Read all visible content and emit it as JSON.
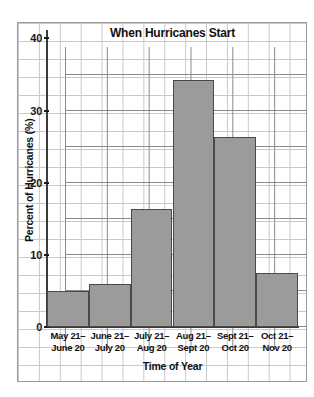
{
  "chart_data": {
    "type": "bar",
    "title": "When Hurricanes Start",
    "xlabel": "Time of Year",
    "ylabel": "Percent of Hurricanes (%)",
    "categories": [
      "May 21– June 20",
      "June 21– July 20",
      "July 21– Aug 20",
      "Aug 21– Sept 20",
      "Sept 21– Oct 20",
      "Oct 21– Nov 20"
    ],
    "category_lines": [
      [
        "May 21–",
        "June 20"
      ],
      [
        "June 21–",
        "July 20"
      ],
      [
        "July 21–",
        "Aug 20"
      ],
      [
        "Aug 21–",
        "Sept 20"
      ],
      [
        "Sept 21–",
        "Oct 20"
      ],
      [
        "Oct 21–",
        "Nov 20"
      ]
    ],
    "values": [
      5,
      6,
      16.3,
      34.3,
      26.4,
      7.5
    ],
    "ylim": [
      0,
      42
    ],
    "yticks": [
      0,
      10,
      20,
      30,
      40
    ],
    "ytick_labels": [
      "0",
      "10",
      "20",
      "30",
      "40"
    ],
    "grid": true,
    "legend": false,
    "bar_color": "#9b9b9b",
    "bar_edge_color": "#4a4a4a",
    "grid_color": "#8a8a8a",
    "minor_grid_color": "#c9c9c9",
    "axis_color": "#3a3a3a",
    "text_color": "#111111",
    "background": "#ffffff"
  }
}
